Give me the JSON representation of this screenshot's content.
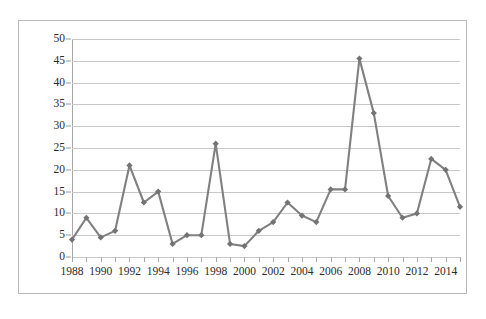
{
  "chart_data": {
    "type": "line",
    "title": "",
    "subtitle": "",
    "xlabel": "",
    "ylabel": "",
    "x": [
      1988,
      1989,
      1990,
      1991,
      1992,
      1993,
      1994,
      1995,
      1996,
      1997,
      1998,
      1999,
      2000,
      2001,
      2002,
      2003,
      2004,
      2005,
      2006,
      2007,
      2008,
      2009,
      2010,
      2011,
      2012,
      2013,
      2014,
      2015
    ],
    "values": [
      4,
      9,
      4.5,
      6,
      21,
      12.5,
      15,
      3,
      5,
      5,
      26,
      3,
      2.5,
      6,
      8,
      12.5,
      9.5,
      8,
      15.5,
      15.5,
      45.5,
      33,
      14,
      9,
      10,
      22.5,
      20,
      11.5
    ],
    "series": [
      {
        "name": "",
        "values": [
          4,
          9,
          4.5,
          6,
          21,
          12.5,
          15,
          3,
          5,
          5,
          26,
          3,
          2.5,
          6,
          8,
          12.5,
          9.5,
          8,
          15.5,
          15.5,
          45.5,
          33,
          14,
          9,
          10,
          22.5,
          20,
          11.5
        ]
      }
    ],
    "ylim": [
      0,
      50
    ],
    "ytick_labels": [
      "0",
      "5",
      "10",
      "15",
      "20",
      "25",
      "30",
      "35",
      "40",
      "45",
      "50"
    ],
    "ytick_values": [
      0,
      5,
      10,
      15,
      20,
      25,
      30,
      35,
      40,
      45,
      50
    ],
    "xtick_labels": [
      "1988",
      "1990",
      "1992",
      "1994",
      "1996",
      "1998",
      "2000",
      "2002",
      "2004",
      "2006",
      "2008",
      "2010",
      "2012",
      "2014"
    ],
    "xtick_values": [
      1988,
      1990,
      1992,
      1994,
      1996,
      1998,
      2000,
      2002,
      2004,
      2006,
      2008,
      2010,
      2012,
      2014
    ],
    "grid": true,
    "legend": false,
    "legend_position": "none",
    "marker": "diamond",
    "colors": {
      "series_line": "#808080",
      "marker": "#737373",
      "gridline": "#c8c8c8",
      "axis": "#a8a8a8",
      "frame": "#b9b9b9",
      "tick_label": "#2b2b2b"
    },
    "annotations": []
  },
  "figure": {
    "caption": ""
  }
}
